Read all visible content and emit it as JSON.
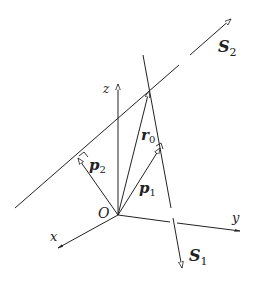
{
  "diagram": {
    "type": "geometry-3d-skew-lines",
    "colors": {
      "stroke": "#222222",
      "background": "#ffffff"
    },
    "axes": {
      "x": {
        "label": "x"
      },
      "y": {
        "label": "y"
      },
      "z": {
        "label": "z"
      }
    },
    "origin": {
      "label": "O"
    },
    "lines": [
      {
        "id": "S1",
        "label_main": "S",
        "label_sub": "1"
      },
      {
        "id": "S2",
        "label_main": "S",
        "label_sub": "2"
      }
    ],
    "vectors": [
      {
        "id": "p1",
        "label_main": "p",
        "label_sub": "1"
      },
      {
        "id": "p2",
        "label_main": "p",
        "label_sub": "2"
      },
      {
        "id": "r0",
        "label_main": "r",
        "label_sub": "0"
      }
    ]
  }
}
